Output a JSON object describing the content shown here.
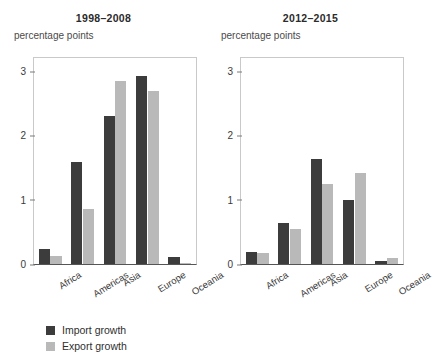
{
  "chart_data": [
    {
      "type": "bar",
      "title": "1998–2008",
      "xlabel": "",
      "ylabel": "percentage points",
      "ylim": [
        0,
        3.2
      ],
      "yticks": [
        0,
        1,
        2,
        3
      ],
      "ytick_labels": [
        "0",
        "1",
        "2",
        "3"
      ],
      "grid": false,
      "legend_position": "below-figure",
      "categories": [
        "Africa",
        "Americas",
        "Asia",
        "Europe",
        "Oceania"
      ],
      "series": [
        {
          "name": "Import growth",
          "color": "#3c3c3c",
          "values": [
            0.23,
            1.58,
            2.3,
            2.92,
            0.11
          ]
        },
        {
          "name": "Export growth",
          "color": "#b9b9b9",
          "values": [
            0.13,
            0.86,
            2.85,
            2.68,
            0.02
          ]
        }
      ]
    },
    {
      "type": "bar",
      "title": "2012–2015",
      "xlabel": "",
      "ylabel": "percentage points",
      "ylim": [
        0,
        3.2
      ],
      "yticks": [
        0,
        1,
        2,
        3
      ],
      "ytick_labels": [
        "0",
        "1",
        "2",
        "3"
      ],
      "grid": false,
      "legend_position": "below-figure",
      "categories": [
        "Africa",
        "Americas",
        "Asia",
        "Europe",
        "Oceania"
      ],
      "series": [
        {
          "name": "Import growth",
          "color": "#3c3c3c",
          "values": [
            0.19,
            0.63,
            1.63,
            0.99,
            0.04
          ]
        },
        {
          "name": "Export growth",
          "color": "#b9b9b9",
          "values": [
            0.17,
            0.54,
            1.24,
            1.42,
            0.09
          ]
        }
      ]
    }
  ],
  "legend": {
    "items": [
      {
        "label": "Import growth",
        "color": "#3c3c3c"
      },
      {
        "label": "Export growth",
        "color": "#b9b9b9"
      }
    ]
  }
}
